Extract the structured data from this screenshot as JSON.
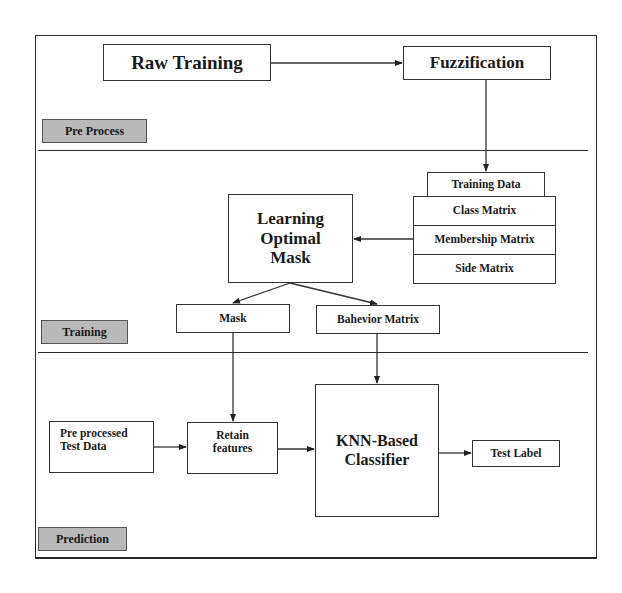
{
  "diagram": {
    "stages": {
      "pre_process": "Pre Process",
      "training": "Training",
      "prediction": "Prediction"
    },
    "nodes": {
      "raw_training": "Raw Training",
      "fuzzification": "Fuzzification",
      "training_data": "Training Data",
      "class_matrix": "Class Matrix",
      "membership_matrix": "Membership Matrix",
      "side_matrix": "Side Matrix",
      "learning_optimal_mask": "Learning Optimal Mask",
      "mask": "Mask",
      "behavior_matrix": "Bahevior Matrix",
      "preprocessed_test_data": "Pre processed Test Data",
      "retain_features": "Retain features",
      "knn_classifier": "KNN-Based Classifier",
      "test_label": "Test Label"
    },
    "edges": [
      {
        "from": "Raw Training",
        "to": "Fuzzification"
      },
      {
        "from": "Fuzzification",
        "to": "Training Data"
      },
      {
        "from": "Membership Matrix",
        "to": "Learning Optimal Mask"
      },
      {
        "from": "Learning Optimal Mask",
        "to": "Mask"
      },
      {
        "from": "Learning Optimal Mask",
        "to": "Bahevior Matrix"
      },
      {
        "from": "Mask",
        "to": "Retain features"
      },
      {
        "from": "Bahevior Matrix",
        "to": "KNN-Based Classifier"
      },
      {
        "from": "Pre processed Test Data",
        "to": "Retain features"
      },
      {
        "from": "Retain features",
        "to": "KNN-Based Classifier"
      },
      {
        "from": "KNN-Based Classifier",
        "to": "Test Label"
      }
    ]
  }
}
